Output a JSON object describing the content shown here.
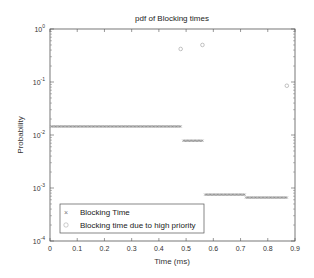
{
  "chart_data": {
    "type": "scatter",
    "title": "pdf of Blocking times",
    "xlabel": "Time (ms)",
    "ylabel": "Probability",
    "xlim": [
      0,
      0.9
    ],
    "ylim": [
      0.0001,
      1
    ],
    "yscale": "log",
    "xticks": [
      "0",
      "0.1",
      "0.2",
      "0.3",
      "0.4",
      "0.5",
      "0.6",
      "0.7",
      "0.8",
      "0.9"
    ],
    "yticks": [
      {
        "base": "10",
        "exp": "0"
      },
      {
        "base": "10",
        "exp": "-1"
      },
      {
        "base": "10",
        "exp": "-2"
      },
      {
        "base": "10",
        "exp": "-3"
      },
      {
        "base": "10",
        "exp": "-4"
      }
    ],
    "grid": false,
    "legend_position": "lower left",
    "series": [
      {
        "name": "Blocking Time",
        "marker": "x",
        "color": "#666666",
        "segments": [
          {
            "x_start": 0.005,
            "x_end": 0.48,
            "step": 0.005,
            "y": 0.0145
          },
          {
            "x_start": 0.49,
            "x_end": 0.56,
            "step": 0.005,
            "y": 0.0078
          },
          {
            "x_start": 0.57,
            "x_end": 0.715,
            "step": 0.005,
            "y": 0.00075
          },
          {
            "x_start": 0.72,
            "x_end": 0.87,
            "step": 0.005,
            "y": 0.00066
          }
        ]
      },
      {
        "name": "Blocking time due to high priority",
        "marker": "o",
        "color": "#9a9a9a",
        "points": [
          {
            "x": 0.48,
            "y": 0.42
          },
          {
            "x": 0.56,
            "y": 0.5
          },
          {
            "x": 0.87,
            "y": 0.085
          }
        ]
      }
    ]
  }
}
